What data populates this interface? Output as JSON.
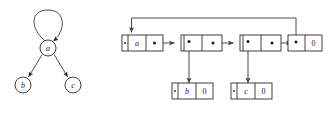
{
  "figure": {
    "background_color": "#ffffff",
    "stroke_color": "#2b2b2b",
    "link_color": "#4a4a4a"
  },
  "graph": {
    "name": "directed-graph",
    "nodes": [
      {
        "id": "a",
        "label": "a",
        "cx": 48,
        "cy": 48,
        "r": 8
      },
      {
        "id": "b",
        "label": "b",
        "cx": 23,
        "cy": 85,
        "r": 8
      },
      {
        "id": "c",
        "label": "c",
        "cx": 73,
        "cy": 85,
        "r": 8
      }
    ],
    "edges": [
      {
        "from": "a",
        "to": "a",
        "type": "self-loop"
      },
      {
        "from": "a",
        "to": "b",
        "type": "directed"
      },
      {
        "from": "a",
        "to": "c",
        "type": "directed"
      }
    ]
  },
  "adjacency_list": {
    "name": "adjacency-list-diagram",
    "head_nodes": [
      {
        "id": "node-a",
        "cells": [
          {
            "kind": "marker",
            "value": ""
          },
          {
            "kind": "key",
            "value": "a"
          },
          {
            "kind": "pointer",
            "value": ""
          }
        ]
      },
      {
        "id": "node-2",
        "cells": [
          {
            "kind": "marker",
            "value": ""
          },
          {
            "kind": "pointer",
            "value": ""
          },
          {
            "kind": "pointer",
            "value": ""
          }
        ]
      },
      {
        "id": "node-3",
        "cells": [
          {
            "kind": "marker",
            "value": ""
          },
          {
            "kind": "pointer",
            "value": ""
          },
          {
            "kind": "pointer",
            "value": ""
          }
        ]
      },
      {
        "id": "node-4",
        "cells": [
          {
            "kind": "pointer",
            "value": ""
          },
          {
            "kind": "nil",
            "value": "0"
          }
        ]
      }
    ],
    "child_nodes": [
      {
        "id": "child-b",
        "cells": [
          {
            "kind": "marker",
            "value": ""
          },
          {
            "kind": "key",
            "value": "b"
          },
          {
            "kind": "nil",
            "value": "0"
          }
        ]
      },
      {
        "id": "child-c",
        "cells": [
          {
            "kind": "marker",
            "value": ""
          },
          {
            "kind": "key",
            "value": "c"
          },
          {
            "kind": "nil",
            "value": "0"
          }
        ]
      }
    ],
    "labels": {
      "key_a": "a",
      "key_b": "b",
      "key_c": "c",
      "nil_1": "0",
      "nil_2": "0",
      "nil_3": "0"
    },
    "links": [
      {
        "from": "node-a",
        "to": "node-2",
        "direction": "right"
      },
      {
        "from": "node-2",
        "to": "node-3",
        "direction": "right"
      },
      {
        "from": "node-3",
        "to": "node-4",
        "direction": "right"
      },
      {
        "from": "node-2",
        "to": "child-b",
        "direction": "down"
      },
      {
        "from": "node-3",
        "to": "child-c",
        "direction": "down"
      },
      {
        "from": "node-4",
        "to": "node-a",
        "direction": "feedback-top"
      }
    ]
  }
}
